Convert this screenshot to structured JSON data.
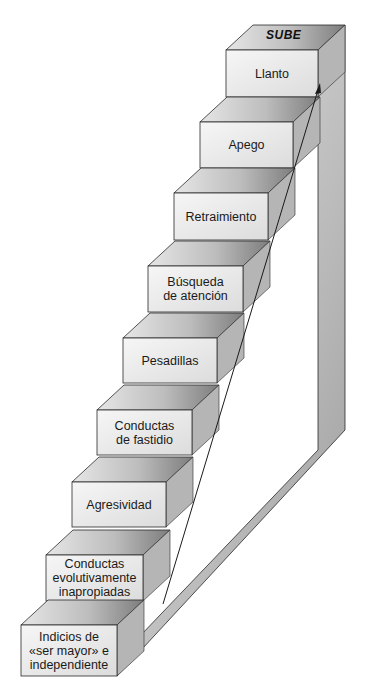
{
  "diagram": {
    "type": "staircase",
    "top_label": "SUBE",
    "arrow_direction": "up",
    "steps": [
      {
        "label": "Llanto"
      },
      {
        "label": "Apego"
      },
      {
        "label": "Retraimiento"
      },
      {
        "label": "Búsqueda\nde atención"
      },
      {
        "label": "Pesadillas"
      },
      {
        "label": "Conductas\nde fastidio"
      },
      {
        "label": "Agresividad"
      },
      {
        "label": "Conductas\nevolutivamente\ninapropiadas"
      },
      {
        "label": "Indicios de\n«ser mayor» e\nindependiente"
      }
    ]
  },
  "colors": {
    "front_face": "#ececec",
    "tread_light": "#d6d6d6",
    "tread_dark": "#8a8a8a",
    "side_light": "#d2d2d2",
    "side_dark": "#9a9a9a",
    "outline": "#2a2a2a"
  }
}
